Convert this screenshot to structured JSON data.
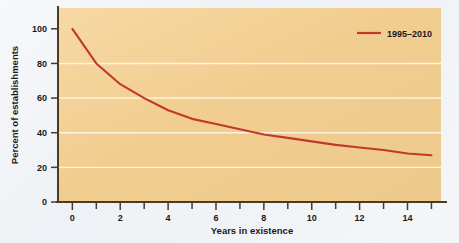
{
  "figure": {
    "page_background": "#f4f6f8",
    "plot_background": "#f2ce93",
    "axis_color": "#4a3a2a",
    "gridline_color": "#fdf3e2",
    "series_color": "#c0392b"
  },
  "chart_data": {
    "type": "line",
    "title": "",
    "xlabel": "Years in existence",
    "ylabel": "Percent of establishments",
    "xlim": [
      -0.6,
      15.4
    ],
    "ylim": [
      0,
      112
    ],
    "grid": true,
    "gridlines_y": [
      20,
      40,
      60,
      80
    ],
    "legend_position": "top-right",
    "xticks": [
      0,
      2,
      4,
      6,
      8,
      10,
      12,
      14
    ],
    "xticklabels": [
      "0",
      "2",
      "4",
      "6",
      "8",
      "10",
      "12",
      "14"
    ],
    "xminorticks": [
      1,
      3,
      5,
      7,
      9,
      11,
      13,
      15
    ],
    "yticks": [
      0,
      20,
      40,
      60,
      80,
      100
    ],
    "yticklabels": [
      "0",
      "20",
      "40",
      "60",
      "80",
      "100"
    ],
    "series": [
      {
        "name": "1995–2010",
        "color": "#c0392b",
        "x": [
          0,
          1,
          2,
          3,
          4,
          5,
          6,
          7,
          8,
          9,
          10,
          11,
          12,
          13,
          14,
          15
        ],
        "values": [
          100,
          80,
          68,
          60,
          53,
          48,
          45,
          42,
          39,
          37,
          35,
          33,
          31.5,
          30,
          28,
          27
        ]
      }
    ]
  },
  "legend": {
    "entries": [
      {
        "label": "1995–2010",
        "color": "#c0392b"
      }
    ]
  },
  "axes": {
    "x_title": "Years in existence",
    "y_title": "Percent of establishments"
  }
}
